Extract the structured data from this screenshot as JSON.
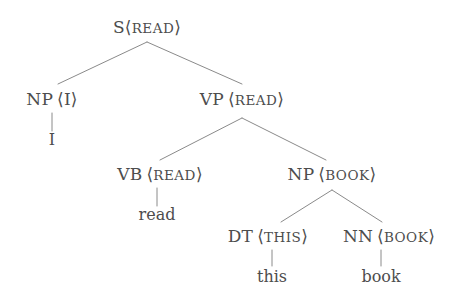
{
  "figure": {
    "kind": "constituency-parse-tree",
    "sentence": "I read this book",
    "colors": {
      "background": "#ffffff",
      "text": "#4d4d4d",
      "edge": "#8a8a8a"
    }
  },
  "nodes": {
    "s_read": {
      "category": "S",
      "head": "READ",
      "spaced": false,
      "open": "⟨",
      "close": "⟩"
    },
    "np_i": {
      "category": "NP",
      "head": "I",
      "spaced": true,
      "open": "⟨",
      "close": "⟩"
    },
    "vp_read": {
      "category": "VP",
      "head": "READ",
      "spaced": true,
      "open": "⟨",
      "close": "⟩"
    },
    "vb_read": {
      "category": "VB",
      "head": "READ",
      "spaced": true,
      "open": "⟨",
      "close": "⟩"
    },
    "np_book": {
      "category": "NP",
      "head": "BOOK",
      "spaced": true,
      "open": "⟨",
      "close": "⟩"
    },
    "dt_this": {
      "category": "DT",
      "head": "THIS",
      "spaced": true,
      "open": "⟨",
      "close": "⟩"
    },
    "nn_book": {
      "category": "NN",
      "head": "BOOK",
      "spaced": true,
      "open": "⟨",
      "close": "⟩"
    }
  },
  "leaves": {
    "leaf_i": "I",
    "leaf_read": "read",
    "leaf_this": "this",
    "leaf_book": "book"
  }
}
